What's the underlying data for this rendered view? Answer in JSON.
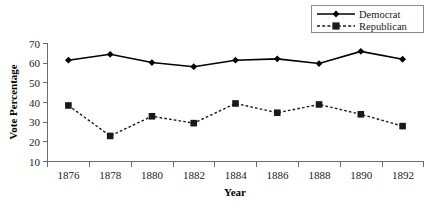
{
  "chart_data": {
    "type": "line",
    "title": "",
    "xlabel": "Year",
    "ylabel": "Vote Percentage",
    "categories": [
      "1876",
      "1878",
      "1880",
      "1882",
      "1884",
      "1886",
      "1888",
      "1890",
      "1892"
    ],
    "x": [
      1876,
      1878,
      1880,
      1882,
      1884,
      1886,
      1888,
      1890,
      1892
    ],
    "series": [
      {
        "name": "Democrat",
        "values": [
          61.5,
          64.5,
          60.3,
          58.2,
          61.5,
          62.2,
          59.8,
          66.0,
          62.0
        ],
        "line_style": "solid",
        "marker": "diamond",
        "color": "#000000"
      },
      {
        "name": "Republican",
        "values": [
          38.5,
          23.0,
          33.0,
          29.5,
          39.5,
          34.8,
          39.0,
          34.0,
          28.0
        ],
        "line_style": "dashed",
        "marker": "square",
        "color": "#1a1a1a"
      }
    ],
    "ylim": [
      10,
      70
    ],
    "yticks": [
      10,
      20,
      30,
      40,
      50,
      60,
      70
    ],
    "ytick_labels": [
      "10",
      "20",
      "30",
      "40",
      "50",
      "60",
      "70"
    ],
    "grid": false,
    "legend_position": "top-right"
  },
  "legend": {
    "entries": [
      {
        "label": "Democrat"
      },
      {
        "label": "Republican"
      }
    ]
  },
  "axes": {
    "y_title": "Vote Percentage",
    "x_title": "Year"
  }
}
